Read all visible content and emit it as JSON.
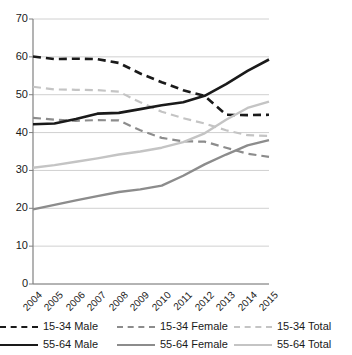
{
  "chart_data": {
    "type": "line",
    "title": "",
    "subtitle": "",
    "xlabel": "",
    "ylabel": "",
    "x": [
      "2004",
      "2005",
      "2006",
      "2007",
      "2008",
      "2009",
      "2010",
      "2011",
      "2012",
      "2013",
      "2014",
      "2015"
    ],
    "categories": [
      "2004",
      "2005",
      "2006",
      "2007",
      "2008",
      "2009",
      "2010",
      "2011",
      "2012",
      "2013",
      "2014",
      "2015"
    ],
    "ylim": [
      0,
      70
    ],
    "yticks": [
      0,
      10,
      20,
      30,
      40,
      50,
      60,
      70
    ],
    "ytick_labels": [
      "0",
      "10",
      "20",
      "30",
      "40",
      "50",
      "60",
      "70"
    ],
    "grid": true,
    "grid_axis": "y",
    "legend_position": "bottom",
    "legend_columns": 3,
    "series": [
      {
        "name": "15-34 Male",
        "style": "dashed",
        "color": "#1a1a1a",
        "width": 2.6,
        "values": [
          60.1,
          59.4,
          59.5,
          59.4,
          58.4,
          55.6,
          53.3,
          51.2,
          49.7,
          44.7,
          44.6,
          44.7
        ]
      },
      {
        "name": "15-34 Female",
        "style": "dashed",
        "color": "#8c8c8c",
        "width": 2.2,
        "values": [
          43.9,
          43.4,
          43.1,
          43.3,
          43.2,
          40.6,
          38.6,
          37.7,
          37.6,
          36.0,
          34.4,
          33.6
        ]
      },
      {
        "name": "15-34 Total",
        "style": "dashed",
        "color": "#c4c4c4",
        "width": 2.2,
        "values": [
          52.1,
          51.4,
          51.3,
          51.2,
          50.8,
          48.0,
          45.5,
          43.8,
          42.4,
          40.6,
          39.3,
          39.1
        ]
      },
      {
        "name": "55-64 Male",
        "style": "solid",
        "color": "#1a1a1a",
        "width": 2.6,
        "values": [
          42.2,
          42.4,
          43.6,
          45.0,
          45.2,
          46.2,
          47.2,
          48.0,
          49.7,
          52.8,
          56.3,
          59.3
        ]
      },
      {
        "name": "55-64 Female",
        "style": "solid",
        "color": "#8c8c8c",
        "width": 2.4,
        "values": [
          19.7,
          20.9,
          22.1,
          23.2,
          24.3,
          25.0,
          26.0,
          28.6,
          31.6,
          34.2,
          36.6,
          38.0
        ]
      },
      {
        "name": "55-64 Total",
        "style": "solid",
        "color": "#c4c4c4",
        "width": 2.4,
        "values": [
          30.7,
          31.4,
          32.3,
          33.2,
          34.2,
          35.0,
          36.0,
          37.5,
          39.8,
          43.4,
          46.5,
          48.2
        ]
      }
    ]
  },
  "legend": {
    "items": [
      {
        "label": "15-34 Male",
        "style": "dashed",
        "color": "#1a1a1a",
        "width": 2.6
      },
      {
        "label": "15-34 Female",
        "style": "dashed",
        "color": "#8c8c8c",
        "width": 2.2
      },
      {
        "label": "15-34 Total",
        "style": "dashed",
        "color": "#c4c4c4",
        "width": 2.2
      },
      {
        "label": "55-64 Male",
        "style": "solid",
        "color": "#1a1a1a",
        "width": 2.6
      },
      {
        "label": "55-64 Female",
        "style": "solid",
        "color": "#8c8c8c",
        "width": 2.4
      },
      {
        "label": "55-64 Total",
        "style": "solid",
        "color": "#c4c4c4",
        "width": 2.4
      }
    ]
  },
  "axes": {
    "y_tick_labels": [
      "70",
      "60",
      "50",
      "40",
      "30",
      "20",
      "10",
      "0"
    ],
    "x_tick_labels": [
      "2004",
      "2005",
      "2006",
      "2007",
      "2008",
      "2009",
      "2010",
      "2011",
      "2012",
      "2013",
      "2014",
      "2015"
    ]
  },
  "colors": {
    "axis": "#808080",
    "grid": "#d0d0d0",
    "text": "#1a1a1a",
    "series_dark": "#1a1a1a",
    "series_mid": "#8c8c8c",
    "series_light": "#c4c4c4"
  }
}
